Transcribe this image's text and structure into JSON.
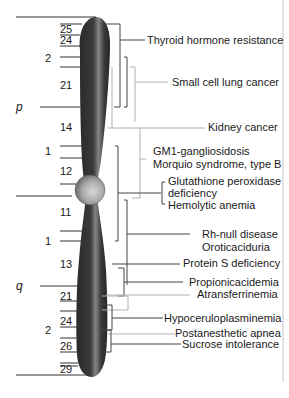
{
  "diagram": {
    "type": "chromosome-ideogram",
    "arms": {
      "p": "p",
      "q": "q"
    },
    "regions": {
      "p2": "2",
      "p1": "1",
      "q1": "1",
      "q2": "2"
    },
    "bands": {
      "p25": "25",
      "p24": "24",
      "p21": "21",
      "p14": "14",
      "p12": "12",
      "q11": "11",
      "q13": "13",
      "q21": "21",
      "q24": "24",
      "q26": "26",
      "q29": "29"
    },
    "diseases": [
      {
        "id": "thyroid",
        "label": "Thyroid hormone resistance"
      },
      {
        "id": "sclc",
        "label": "Small cell lung cancer"
      },
      {
        "id": "kidney",
        "label": "Kidney cancer"
      },
      {
        "id": "gm1",
        "label": "GM1-gangliosidosis"
      },
      {
        "id": "morquio",
        "label": "Morquio syndrome, type B"
      },
      {
        "id": "gpx1",
        "label": "Glutathione peroxidase"
      },
      {
        "id": "gpx2",
        "label": "deficiency"
      },
      {
        "id": "hemolytic",
        "label": "Hemolytic anemia"
      },
      {
        "id": "rhnull",
        "label": "Rh-null disease"
      },
      {
        "id": "orotic",
        "label": "Oroticaciduria"
      },
      {
        "id": "proteins",
        "label": "Protein S deficiency"
      },
      {
        "id": "propionic",
        "label": "Propionicacidemia"
      },
      {
        "id": "atransferrin",
        "label": "Atransferrinemia"
      },
      {
        "id": "hypocerulo",
        "label": "Hypoceruloplasminemia"
      },
      {
        "id": "postanesthetic",
        "label": "Postanesthetic apnea"
      },
      {
        "id": "sucrose",
        "label": "Sucrose intolerance"
      }
    ],
    "colors": {
      "chromosome_dark": "#2e2e2e",
      "chromosome_highlight": "#7a7a7a",
      "centromere": "#a8a8a8",
      "bracket_dark": "#444444",
      "bracket_light": "#b0b0b0",
      "frame_line": "#bdbdbd"
    }
  }
}
